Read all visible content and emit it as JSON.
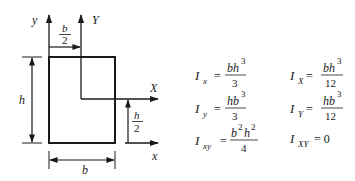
{
  "diagram": {
    "colors": {
      "stroke": "#1a1a1a",
      "background": "#ffffff"
    },
    "labels": {
      "y_axis": "y",
      "Y_axis": "Y",
      "x_axis": "x",
      "X_axis": "X",
      "height": "h",
      "width": "b",
      "half_width_num": "b",
      "half_width_den": "2",
      "half_height_num": "h",
      "half_height_den": "2"
    }
  },
  "formulas": {
    "left": [
      {
        "I": "I",
        "sub": "x",
        "num": "bh",
        "num_sup": "3",
        "den": "3"
      },
      {
        "I": "I",
        "sub": "y",
        "num": "hb",
        "num_sup": "3",
        "den": "3"
      },
      {
        "I": "I",
        "sub": "xy",
        "num_a": "b",
        "sup_a": "2",
        "num_b": "h",
        "sup_b": "2",
        "den": "4"
      }
    ],
    "right": [
      {
        "I": "I",
        "sub": "X",
        "num": "bh",
        "num_sup": "3",
        "den": "12"
      },
      {
        "I": "I",
        "sub": "Y",
        "num": "hb",
        "num_sup": "3",
        "den": "12"
      },
      {
        "I": "I",
        "sub": "XY",
        "value": "= 0"
      }
    ],
    "equals": "="
  }
}
